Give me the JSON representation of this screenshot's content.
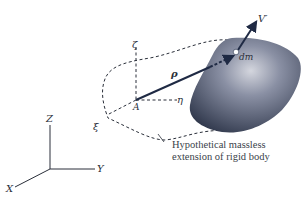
{
  "diagram": {
    "labels": {
      "velocity": "V′",
      "mass_element": "dm",
      "position_vector": "ρ",
      "zeta": "ζ",
      "eta": "η",
      "xi": "ξ",
      "point_A": "A",
      "axis_Z": "Z",
      "axis_Y": "Y",
      "axis_X": "X"
    },
    "caption": {
      "line1": "Hypothetical massless",
      "line2": "extension of rigid body"
    },
    "colors": {
      "body_dark": "#2c3448",
      "body_light": "#c9ccd6",
      "line": "#2a2f3a",
      "vector": "#1f2a44"
    }
  }
}
